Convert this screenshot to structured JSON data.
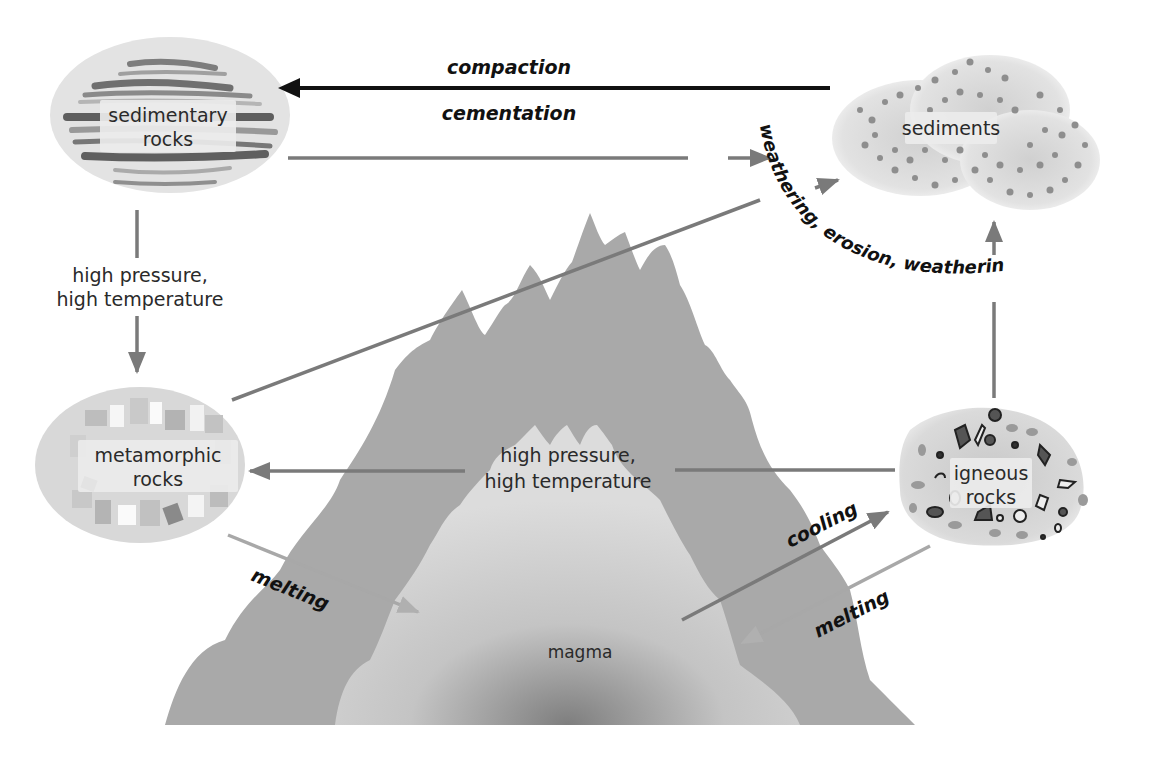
{
  "colors": {
    "background": "#ffffff",
    "arrow_dark": "#111111",
    "arrow_gray": "#7a7a7a",
    "mountain_outer": "#a8a8a8",
    "mountain_inner": "#d4d4d4",
    "magma_core": "#8a8a8a",
    "label_text": "#2a2a2a"
  },
  "nodes": {
    "sedimentary": {
      "line1": "sedimentary",
      "line2": "rocks"
    },
    "sediments": {
      "line1": "sediments"
    },
    "metamorphic": {
      "line1": "metamorphic",
      "line2": "rocks"
    },
    "igneous": {
      "line1": "igneous",
      "line2": "rocks"
    },
    "magma": {
      "line1": "magma"
    }
  },
  "processes": {
    "compaction": "compaction",
    "cementation": "cementation",
    "weathering_arc": "weathering, erosion, weathering",
    "sed_to_meta_line1": "high pressure,",
    "sed_to_meta_line2": "high temperature",
    "ign_to_meta_line1": "high pressure,",
    "ign_to_meta_line2": "high temperature",
    "melting_left": "melting",
    "melting_right": "melting",
    "cooling": "cooling"
  },
  "edges": [
    {
      "from": "sediments",
      "to": "sedimentary rocks",
      "label": "compaction / cementation",
      "style": "dark"
    },
    {
      "from": "sedimentary rocks",
      "to": "sediments",
      "label": "weathering",
      "style": "gray"
    },
    {
      "from": "metamorphic rocks",
      "to": "sediments",
      "label": "erosion",
      "style": "gray"
    },
    {
      "from": "igneous rocks",
      "to": "sediments",
      "label": "weathering",
      "style": "gray"
    },
    {
      "from": "sedimentary rocks",
      "to": "metamorphic rocks",
      "label": "high pressure, high temperature",
      "style": "gray"
    },
    {
      "from": "igneous rocks",
      "to": "metamorphic rocks",
      "label": "high pressure, high temperature",
      "style": "gray"
    },
    {
      "from": "metamorphic rocks",
      "to": "magma",
      "label": "melting",
      "style": "gray"
    },
    {
      "from": "igneous rocks",
      "to": "magma",
      "label": "melting",
      "style": "gray"
    },
    {
      "from": "magma",
      "to": "igneous rocks",
      "label": "cooling",
      "style": "gray"
    }
  ]
}
